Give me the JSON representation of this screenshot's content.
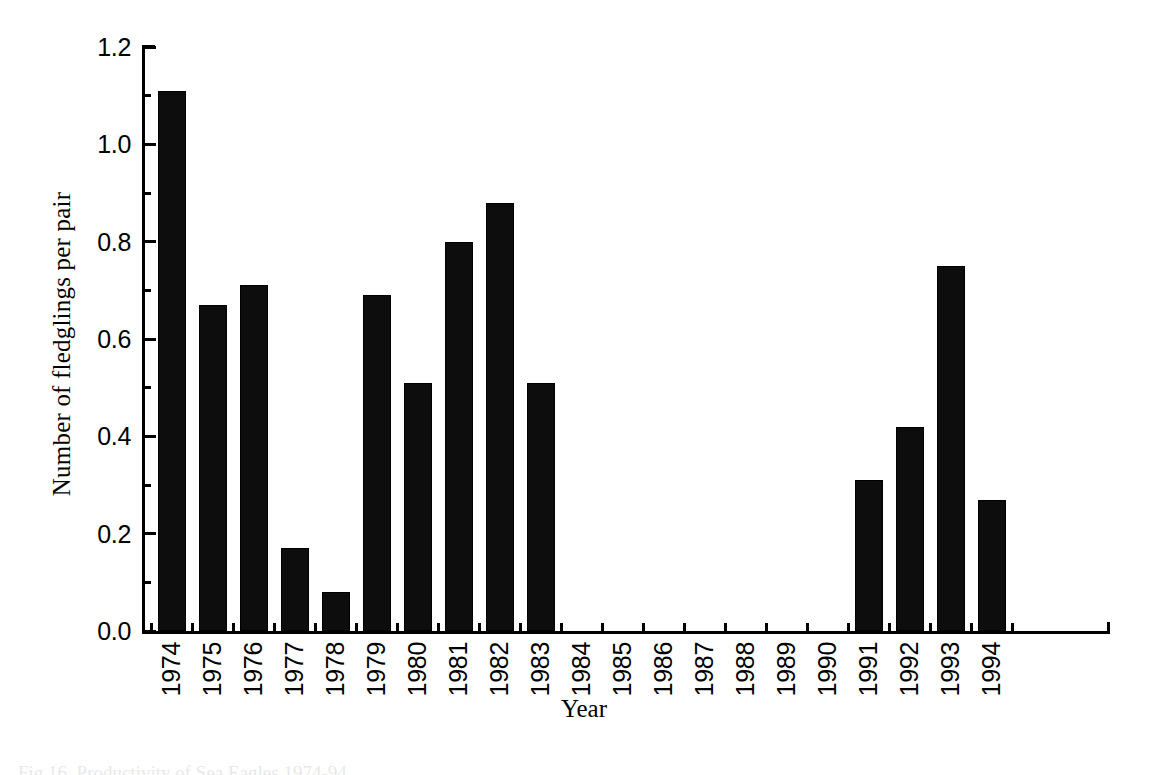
{
  "chart_data": {
    "type": "bar",
    "title": "",
    "xlabel": "Year",
    "ylabel": "Number of fledglings per pair",
    "categories": [
      "1974",
      "1975",
      "1976",
      "1977",
      "1978",
      "1979",
      "1980",
      "1981",
      "1982",
      "1983",
      "1984",
      "1985",
      "1986",
      "1987",
      "1988",
      "1989",
      "1990",
      "1991",
      "1992",
      "1993",
      "1994"
    ],
    "values": [
      1.11,
      0.67,
      0.71,
      0.17,
      0.08,
      0.69,
      0.51,
      0.8,
      0.88,
      0.51,
      0.0,
      0.0,
      0.0,
      0.0,
      0.0,
      0.0,
      0.0,
      0.31,
      0.42,
      0.75,
      0.27
    ],
    "ylim": [
      0.0,
      1.2
    ],
    "xlim_categories": 21,
    "ytick_labels": [
      "0.0",
      "0.2",
      "0.4",
      "0.6",
      "0.8",
      "1.0",
      "1.2"
    ],
    "ytick_values": [
      0.0,
      0.2,
      0.4,
      0.6,
      0.8,
      1.0,
      1.2
    ],
    "yminor_tick_values": [
      0.1,
      0.3,
      0.5,
      0.7,
      0.9,
      1.1
    ],
    "grid": false,
    "legend": false,
    "bar_color": "#0d0d0d",
    "axis_color": "#000000",
    "background": "#ffffff"
  },
  "caption": {
    "text": "Fig 16. Productivity of Sea Eagles 1974-94"
  }
}
